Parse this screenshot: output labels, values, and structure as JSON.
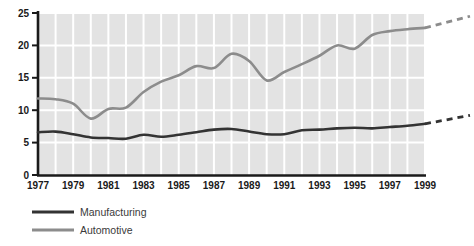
{
  "chart_data": {
    "type": "line",
    "title": "",
    "xlabel": "",
    "ylabel": "",
    "xlim": [
      1977,
      1999
    ],
    "ylim": [
      0,
      25
    ],
    "grid": true,
    "legend_position": "bottom-left",
    "x": [
      1977,
      1978,
      1979,
      1980,
      1981,
      1982,
      1983,
      1984,
      1985,
      1986,
      1987,
      1988,
      1989,
      1990,
      1991,
      1992,
      1993,
      1994,
      1995,
      1996,
      1997,
      1998,
      1999
    ],
    "yticks": [
      "0",
      "5",
      "10",
      "15",
      "20",
      "25"
    ],
    "xticks": [
      "1977",
      "1979",
      "1981",
      "1983",
      "1985",
      "1987",
      "1989",
      "1991",
      "1993",
      "1995",
      "1997",
      "1999"
    ],
    "series": [
      {
        "name": "Manufacturing",
        "color": "#333333",
        "values": [
          6.6,
          6.7,
          6.3,
          5.8,
          5.7,
          5.6,
          6.2,
          5.9,
          6.2,
          6.6,
          7.0,
          7.1,
          6.7,
          6.3,
          6.3,
          6.9,
          7.0,
          7.2,
          7.3,
          7.2,
          7.4,
          7.6,
          7.9
        ],
        "projection": {
          "from_x": 1999,
          "from_y": 7.9,
          "to_y": 9.2,
          "style": "dashed"
        }
      },
      {
        "name": "Automotive",
        "color": "#8c8c8c",
        "values": [
          11.8,
          11.7,
          11.0,
          8.7,
          10.2,
          10.4,
          12.8,
          14.4,
          15.4,
          16.8,
          16.5,
          18.7,
          17.6,
          14.6,
          15.9,
          17.1,
          18.4,
          20.0,
          19.5,
          21.6,
          22.2,
          22.5,
          22.7
        ],
        "projection": {
          "from_x": 1999,
          "from_y": 22.7,
          "to_y": 24.5,
          "style": "dashed"
        }
      }
    ]
  },
  "legend": {
    "items": [
      {
        "label": "Manufacturing",
        "color": "#333333"
      },
      {
        "label": "Automotive",
        "color": "#8c8c8c"
      }
    ]
  },
  "colors": {
    "plot_background": "#e3e3e3",
    "gridline": "#ffffff",
    "axis": "#1a1a1a",
    "manufacturing": "#333333",
    "automotive": "#8c8c8c",
    "page_background": "#ffffff"
  }
}
